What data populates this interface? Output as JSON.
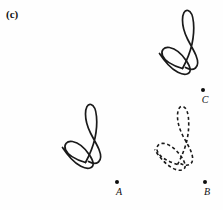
{
  "figure": {
    "panel_label": "(c)",
    "background_color": "#fefefe",
    "ink_color": "#1a1a1a",
    "width": 223,
    "height": 210
  },
  "shapes": [
    {
      "id": "shape-top-right",
      "name": "scribble-solid-top-right",
      "style": "solid",
      "x": 152,
      "y": 6,
      "description": "looped scribble figure, upper right, solid outline"
    },
    {
      "id": "shape-lower-left",
      "name": "scribble-solid-lower-left",
      "style": "solid",
      "x": 55,
      "y": 100,
      "description": "looped scribble figure, lower left, solid outline"
    },
    {
      "id": "shape-lower-right",
      "name": "scribble-dashed-lower-right",
      "style": "dashed",
      "x": 147,
      "y": 102,
      "description": "looped scribble figure, lower right, dashed outline"
    }
  ],
  "points": [
    {
      "id": "point-a",
      "label": "A",
      "x": 117,
      "y": 182
    },
    {
      "id": "point-b",
      "label": "B",
      "x": 205,
      "y": 182
    },
    {
      "id": "point-c",
      "label": "C",
      "x": 203,
      "y": 90
    }
  ]
}
